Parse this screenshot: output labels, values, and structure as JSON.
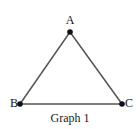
{
  "figure": {
    "caption": "Graph 1",
    "background_color": "#ffffff",
    "width": 140,
    "height": 129
  },
  "graph": {
    "type": "undirected-triangle-graph",
    "edge_color": "#565656",
    "vertex_color": "#111111",
    "label_color": "#151515",
    "vertices": [
      {
        "id": "A",
        "label": "A",
        "x": 70,
        "y": 32,
        "label_x": 70,
        "label_y": 20
      },
      {
        "id": "B",
        "label": "B",
        "x": 20,
        "y": 104,
        "label_x": 11,
        "label_y": 103
      },
      {
        "id": "C",
        "label": "C",
        "x": 122,
        "y": 104,
        "label_x": 130,
        "label_y": 103
      }
    ],
    "edges": [
      {
        "id": "AB",
        "from": "A",
        "to": "B"
      },
      {
        "id": "AC",
        "from": "A",
        "to": "C"
      },
      {
        "id": "BC",
        "from": "B",
        "to": "C"
      }
    ]
  }
}
